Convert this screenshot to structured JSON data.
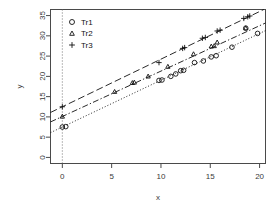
{
  "chart_data": {
    "type": "scatter",
    "title": "",
    "xlabel": "x",
    "ylabel": "y",
    "xlim": [
      -1.2,
      20.6
    ],
    "ylim": [
      -1.5,
      36.5
    ],
    "xticks": [
      0,
      5,
      10,
      15,
      20
    ],
    "yticks": [
      0,
      5,
      10,
      15,
      20,
      25,
      30,
      35
    ],
    "grid": false,
    "reference_lines": [
      {
        "name": "x-zero-dotted-vline",
        "orientation": "vertical",
        "value": 0,
        "style": "dotted"
      }
    ],
    "legend": {
      "position": "top-left",
      "entries": [
        {
          "label": "Tr1",
          "marker": "circle"
        },
        {
          "label": "Tr2",
          "marker": "triangle"
        },
        {
          "label": "Tr3",
          "marker": "plus"
        }
      ]
    },
    "series": [
      {
        "name": "Tr1",
        "marker": "circle",
        "line_style": "dotted",
        "fit": {
          "intercept": 7.5,
          "slope": 1.155
        },
        "points": [
          {
            "x": 0.0,
            "y": 7.5
          },
          {
            "x": 0.35,
            "y": 7.6
          },
          {
            "x": 9.8,
            "y": 19.0
          },
          {
            "x": 10.1,
            "y": 19.1
          },
          {
            "x": 11.0,
            "y": 20.0
          },
          {
            "x": 11.5,
            "y": 20.6
          },
          {
            "x": 12.0,
            "y": 21.4
          },
          {
            "x": 12.3,
            "y": 21.5
          },
          {
            "x": 13.4,
            "y": 23.4
          },
          {
            "x": 14.3,
            "y": 23.8
          },
          {
            "x": 15.1,
            "y": 24.8
          },
          {
            "x": 15.6,
            "y": 25.1
          },
          {
            "x": 17.2,
            "y": 27.2
          },
          {
            "x": 18.6,
            "y": 31.9
          },
          {
            "x": 19.8,
            "y": 30.6
          }
        ]
      },
      {
        "name": "Tr2",
        "marker": "triangle",
        "line_style": "dashdot",
        "fit": {
          "intercept": 10.1,
          "slope": 1.12
        },
        "points": [
          {
            "x": 0.0,
            "y": 10.1
          },
          {
            "x": 5.3,
            "y": 16.2
          },
          {
            "x": 7.1,
            "y": 18.4
          },
          {
            "x": 7.3,
            "y": 18.5
          },
          {
            "x": 8.7,
            "y": 20.0
          },
          {
            "x": 10.7,
            "y": 22.4
          },
          {
            "x": 13.3,
            "y": 25.5
          },
          {
            "x": 15.1,
            "y": 27.4
          },
          {
            "x": 15.4,
            "y": 27.5
          },
          {
            "x": 15.7,
            "y": 28.4
          },
          {
            "x": 18.6,
            "y": 31.9
          }
        ]
      },
      {
        "name": "Tr3",
        "marker": "plus",
        "line_style": "dashed",
        "fit": {
          "intercept": 12.5,
          "slope": 1.175
        },
        "points": [
          {
            "x": 0.0,
            "y": 12.5
          },
          {
            "x": 9.8,
            "y": 23.4
          },
          {
            "x": 12.2,
            "y": 26.9
          },
          {
            "x": 12.4,
            "y": 27.1
          },
          {
            "x": 14.2,
            "y": 29.4
          },
          {
            "x": 14.5,
            "y": 29.6
          },
          {
            "x": 15.7,
            "y": 31.2
          },
          {
            "x": 16.0,
            "y": 31.4
          },
          {
            "x": 18.4,
            "y": 34.3
          },
          {
            "x": 18.8,
            "y": 34.7
          },
          {
            "x": 19.0,
            "y": 34.9
          }
        ]
      }
    ]
  }
}
